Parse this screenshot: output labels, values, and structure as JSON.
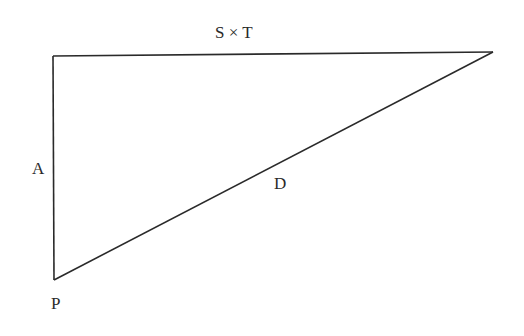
{
  "diagram": {
    "type": "right-triangle",
    "stroke_color": "#2a2a2a",
    "vertices": {
      "top_left": [
        53,
        56
      ],
      "top_right": [
        493,
        52
      ],
      "bottom_left": [
        54,
        280
      ]
    },
    "labels": {
      "top_side": "S × T",
      "left_side": "A",
      "hypotenuse": "D",
      "bottom_vertex": "P"
    }
  }
}
